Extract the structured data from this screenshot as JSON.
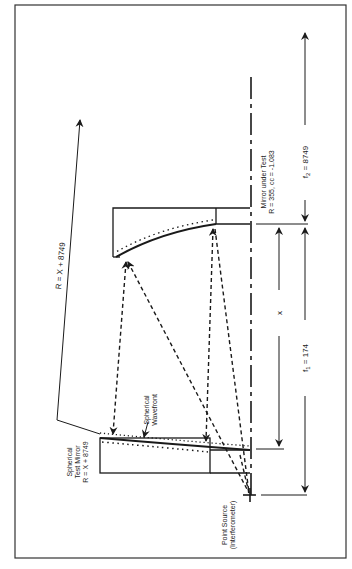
{
  "diagram": {
    "orientation": "rotated 90° counter-clockwise",
    "labels": {
      "mirror_under_test_line1": "Mirror under Test",
      "mirror_under_test_line2": "R = 355, cc = -1.083",
      "spherical_test_mirror_line1": "Spherical",
      "spherical_test_mirror_line2": "Test Mirror",
      "spherical_test_mirror_line3": "R = X + 8749",
      "spherical_wavefront_line1": "Spherical",
      "spherical_wavefront_line2": "Wavefront",
      "point_source_line1": "Point Source",
      "point_source_line2": "(Interferometer)"
    },
    "dimensions": {
      "R": "R = X + 8749",
      "x": "x",
      "f1_prefix": "f",
      "f1_sub": "1",
      "f1_value": " = 174",
      "f2_prefix": "f",
      "f2_sub": "2",
      "f2_value": " = 8749"
    },
    "colors": {
      "line": "#1a1a1a",
      "background": "#ffffff"
    }
  }
}
